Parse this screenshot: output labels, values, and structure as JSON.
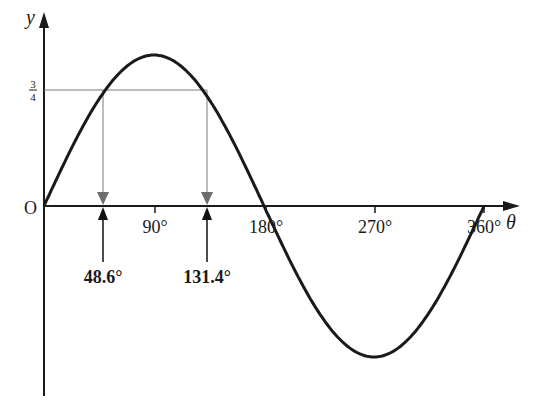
{
  "diagram": {
    "type": "sine-curve-annotated",
    "function": "y = sin θ",
    "labels": {
      "y_axis": "y",
      "x_axis": "θ",
      "origin": "O",
      "fraction_numerator": "3",
      "fraction_denominator": "4",
      "ticks": [
        "90°",
        "180°",
        "270°",
        "360°"
      ],
      "solution_1": "48.6°",
      "solution_2": "131.4°"
    },
    "horizontal_line_value": 0.75,
    "solutions_deg": [
      48.6,
      131.4
    ],
    "x_range_deg": [
      0,
      360
    ],
    "colors": {
      "curve": "#1a1a1a",
      "axes": "#1a1a1a",
      "guide_lines": "#7a7a7a",
      "down_arrows": "#6e6e6e",
      "up_arrows": "#111111"
    }
  }
}
